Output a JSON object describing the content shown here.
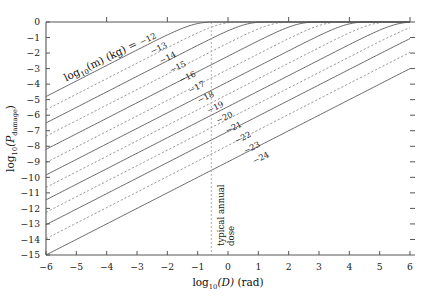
{
  "chart_data": {
    "type": "line",
    "title": "",
    "xlabel": "log10(D)  (rad)",
    "ylabel": "log10(Pdamage)",
    "xlim": [
      -6,
      6
    ],
    "ylim": [
      -15,
      0
    ],
    "xticks": [
      -6,
      -5,
      -4,
      -3,
      -2,
      -1,
      0,
      1,
      2,
      3,
      4,
      5,
      6
    ],
    "yticks": [
      0,
      -1,
      -2,
      -3,
      -4,
      -5,
      -6,
      -7,
      -8,
      -9,
      -10,
      -11,
      -12,
      -13,
      -14,
      -15
    ],
    "xticklabels": [
      "-6",
      "-5",
      "-4",
      "-3",
      "-2",
      "-1",
      "0",
      "1",
      "2",
      "3",
      "4",
      "5",
      "6"
    ],
    "yticklabels": [
      "0",
      "-1",
      "-2",
      "-3",
      "-4",
      "-5",
      "-6",
      "-7",
      "-8",
      "-9",
      "-10",
      "-11",
      "-12",
      "-13",
      "-14",
      "-15"
    ],
    "grid": false,
    "legend_position": "inline-curve-labels",
    "legend_title": "log10(m)  (kg) =",
    "series": [
      {
        "name": "-12",
        "label": "-12",
        "style": "solid",
        "y_at_xmin": -4.8,
        "label_x": -2.6,
        "label_y": -1.25
      },
      {
        "name": "-13",
        "label": "-13",
        "style": "dashed",
        "y_at_xmin": -5.65,
        "label_x": -2.25,
        "label_y": -1.85
      },
      {
        "name": "-14",
        "label": "-14",
        "style": "solid",
        "y_at_xmin": -6.5,
        "label_x": -1.95,
        "label_y": -2.45
      },
      {
        "name": "-15",
        "label": "-15",
        "style": "dashed",
        "y_at_xmin": -7.35,
        "label_x": -1.62,
        "label_y": -3.05
      },
      {
        "name": "-16",
        "label": "-16",
        "style": "solid",
        "y_at_xmin": -8.2,
        "label_x": -1.3,
        "label_y": -3.7
      },
      {
        "name": "-17",
        "label": "-17",
        "style": "dashed",
        "y_at_xmin": -9.05,
        "label_x": -1.0,
        "label_y": -4.35
      },
      {
        "name": "-18",
        "label": "-18",
        "style": "solid",
        "y_at_xmin": -9.85,
        "label_x": -0.7,
        "label_y": -5.0
      },
      {
        "name": "-19",
        "label": "-19",
        "style": "dashed",
        "y_at_xmin": -10.65,
        "label_x": -0.38,
        "label_y": -5.65
      },
      {
        "name": "-20",
        "label": "-20",
        "style": "solid",
        "y_at_xmin": -11.45,
        "label_x": -0.08,
        "label_y": -6.3
      },
      {
        "name": "-21",
        "label": "-21",
        "style": "dashed",
        "y_at_xmin": -12.25,
        "label_x": 0.22,
        "label_y": -6.95
      },
      {
        "name": "-22",
        "label": "-22",
        "style": "solid",
        "y_at_xmin": -13.05,
        "label_x": 0.52,
        "label_y": -7.6
      },
      {
        "name": "-23",
        "label": "-23",
        "style": "dashed",
        "y_at_xmin": -13.95,
        "label_x": 0.82,
        "label_y": -8.25
      },
      {
        "name": "-24",
        "label": "-24",
        "style": "solid",
        "y_at_xmin": -15.0,
        "label_x": 1.12,
        "label_y": -8.9
      }
    ],
    "annotations": [
      {
        "name": "typical-annual-dose",
        "text": "typical annual dose",
        "x": -0.55,
        "orientation": "vertical",
        "line_style": "dashed"
      }
    ]
  },
  "axis": {
    "x_title_main": "log",
    "x_title_sub": "10",
    "x_title_var": "(D)",
    "x_title_unit": "(rad)",
    "y_title_main": "log",
    "y_title_sub": "10",
    "y_title_var_open": "(P",
    "y_title_var_sub": "damage",
    "y_title_var_close": ")"
  },
  "legend": {
    "main": "log",
    "sub": "10",
    "var": "(m)",
    "unit": "(kg)",
    "eq": "="
  },
  "annotation": {
    "typical_annual_dose_line1": "typical annual",
    "typical_annual_dose_line2": "dose"
  },
  "colors": {
    "axis": "#555555",
    "solid_curve": "#555555",
    "dashed_curve": "#888888",
    "guide_line": "#aaaaaa",
    "text": "#1a1a1a",
    "background": "#ffffff"
  }
}
